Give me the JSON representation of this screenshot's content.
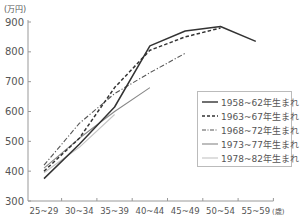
{
  "chart_data": {
    "type": "line",
    "title": "",
    "ylabel": "(万円)",
    "xlabel": "(歳)",
    "categories": [
      "25~29",
      "30~34",
      "35~39",
      "40~44",
      "45~49",
      "50~54",
      "55~59"
    ],
    "ylim": [
      300,
      900
    ],
    "yticks": [
      300,
      400,
      500,
      600,
      700,
      800,
      900
    ],
    "grid": false,
    "legend_position": "right-inside",
    "series": [
      {
        "name": "1958~62年生まれ",
        "style": "solid",
        "color": "#333333",
        "values": [
          375,
          490,
          615,
          820,
          870,
          885,
          835
        ]
      },
      {
        "name": "1963~67年生まれ",
        "style": "dashed",
        "color": "#333333",
        "values": [
          400,
          510,
          680,
          805,
          850,
          880,
          null
        ]
      },
      {
        "name": "1968~72年生まれ",
        "style": "dashdot",
        "color": "#555555",
        "values": [
          420,
          560,
          660,
          730,
          795,
          null,
          null
        ]
      },
      {
        "name": "1973~77年生まれ",
        "style": "solid",
        "color": "#888888",
        "values": [
          410,
          510,
          600,
          680,
          null,
          null,
          null
        ]
      },
      {
        "name": "1978~82年生まれ",
        "style": "solid",
        "color": "#c4c4c4",
        "values": [
          395,
          480,
          590,
          null,
          null,
          null,
          null
        ]
      }
    ]
  },
  "axis": {
    "y_unit": "(万円)",
    "x_unit": "(歳)",
    "y_labels": [
      "900",
      "800",
      "700",
      "600",
      "500",
      "400",
      "300"
    ],
    "x_labels": [
      "25~29",
      "30~34",
      "35~39",
      "40~44",
      "45~49",
      "50~54",
      "55~59"
    ]
  },
  "legend": {
    "items": [
      {
        "label": "1958~62年生まれ"
      },
      {
        "label": "1963~67年生まれ"
      },
      {
        "label": "1968~72年生まれ"
      },
      {
        "label": "1973~77年生まれ"
      },
      {
        "label": "1978~82年生まれ"
      }
    ]
  }
}
